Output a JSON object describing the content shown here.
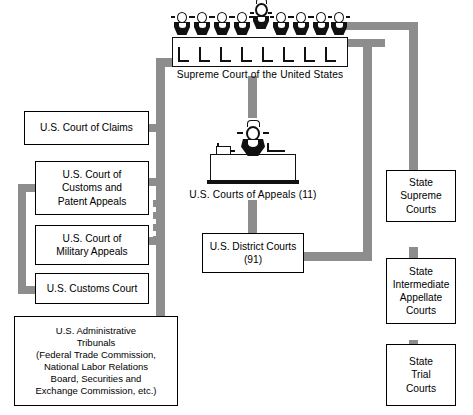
{
  "diagram": {
    "accent_gray": "#8d8d8d",
    "line_black": "#000000"
  },
  "supreme": {
    "caption": "Supreme Court of the United States",
    "justice_count": 9,
    "chief_index": 4
  },
  "appeals": {
    "caption": "U.S. Courts of Appeals (11)"
  },
  "boxes": {
    "district": {
      "line1": "U.S. District Courts",
      "line2": "(91)"
    },
    "claims": {
      "line1": "U.S. Court of Claims"
    },
    "customs_patent": {
      "line1": "U.S. Court of",
      "line2": "Customs and",
      "line3": "Patent Appeals"
    },
    "military": {
      "line1": "U.S. Court of",
      "line2": "Military Appeals"
    },
    "customs_court": {
      "line1": "U.S. Customs Court"
    },
    "administrative": {
      "line1": "U.S. Administrative",
      "line2": "Tribunals",
      "line3": "(Federal Trade Commission,",
      "line4": "National Labor Relations",
      "line5": "Board, Securities and",
      "line6": "Exchange Commission, etc.)"
    },
    "state_supreme": {
      "line1": "State",
      "line2": "Supreme",
      "line3": "Courts"
    },
    "state_intermediate": {
      "line1": "State",
      "line2": "Intermediate",
      "line3": "Appellate",
      "line4": "Courts"
    },
    "state_trial": {
      "line1": "State",
      "line2": "Trial",
      "line3": "Courts"
    }
  }
}
